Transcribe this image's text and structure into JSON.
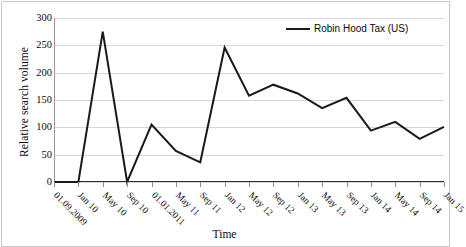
{
  "chart_data": {
    "type": "line",
    "title": "",
    "xlabel": "Time",
    "ylabel": "Relative search volume",
    "ylim": [
      0,
      300
    ],
    "yticks": [
      0,
      50,
      100,
      150,
      200,
      250,
      300
    ],
    "grid": true,
    "legend_position": "top-right",
    "categories": [
      "01.09.2009",
      "Jan 10",
      "May 10",
      "Sep 10",
      "01.01.2011",
      "May 11",
      "Sep 11",
      "Jan 12",
      "May 12",
      "Sep 12",
      "Jan 13",
      "May 13",
      "Sep 13",
      "Jan 14",
      "May 14",
      "Sep 14",
      "Jan 15"
    ],
    "series": [
      {
        "name": "Robin Hood Tax (US)",
        "color": "#1a1a1a",
        "values": [
          0,
          0,
          275,
          0,
          105,
          57,
          36,
          246,
          158,
          178,
          162,
          135,
          154,
          94,
          110,
          79,
          101
        ]
      }
    ]
  },
  "legend": {
    "entries": [
      {
        "label": "Robin Hood Tax (US)",
        "color": "#1a1a1a"
      }
    ]
  },
  "axes": {
    "y_title": "Relative search volume",
    "x_title": "Time"
  }
}
